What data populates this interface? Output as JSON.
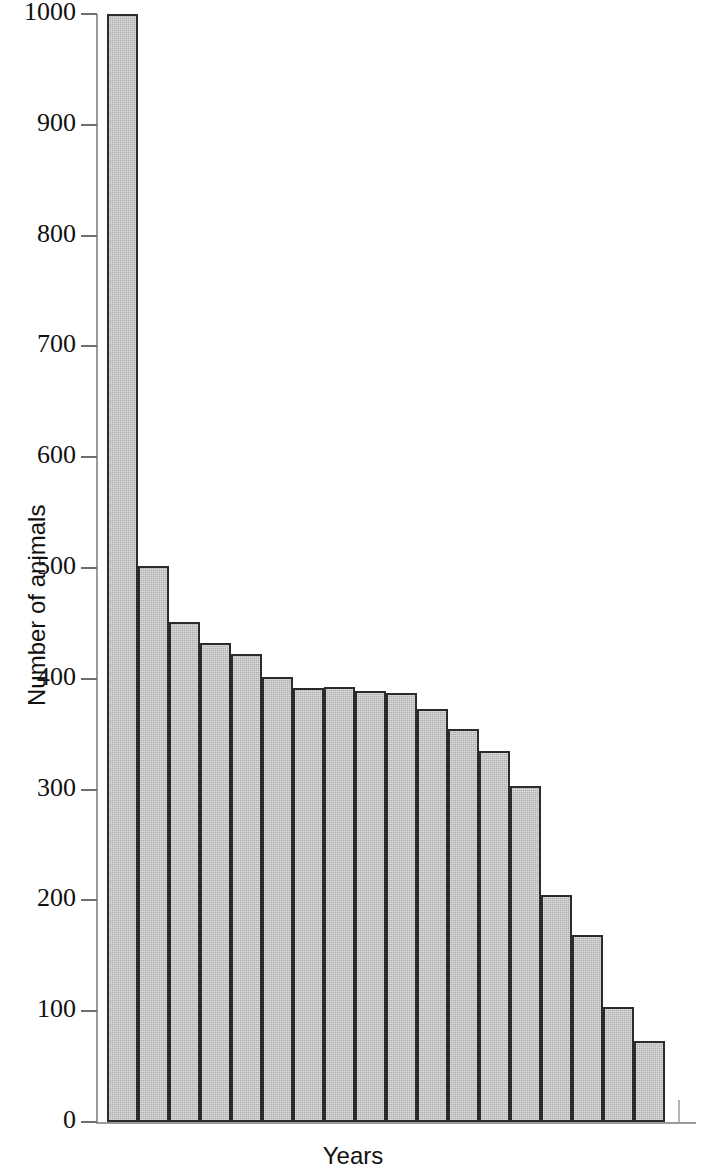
{
  "chart_data": {
    "type": "bar",
    "title": "",
    "xlabel": "Years",
    "ylabel": "Number of animals",
    "ylim": [
      0,
      1000
    ],
    "ytick_labels": [
      "1000",
      "900",
      "800",
      "700",
      "600",
      "500",
      "400",
      "300",
      "200",
      "100",
      "0"
    ],
    "yticks": [
      1000,
      900,
      800,
      700,
      600,
      500,
      400,
      300,
      200,
      100,
      0
    ],
    "grid": false,
    "legend": null,
    "bar_color": "#b0b0b0",
    "bar_edge_color": "#2b2b2b",
    "axis_color": "#9a9a9a",
    "categories": [
      "1",
      "2",
      "3",
      "4",
      "5",
      "6",
      "7",
      "8",
      "9",
      "10",
      "11",
      "12",
      "13",
      "14",
      "15",
      "16",
      "17",
      "18"
    ],
    "xtick_labels": [],
    "values": [
      1000,
      502,
      451,
      432,
      422,
      402,
      392,
      393,
      389,
      387,
      373,
      355,
      335,
      303,
      205,
      169,
      104,
      73
    ]
  },
  "axis": {
    "x_title": "Years",
    "y_title": "Number of animals"
  }
}
